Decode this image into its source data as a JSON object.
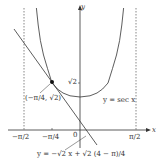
{
  "axes": {
    "x_label": "x",
    "y_label": "y",
    "origin_label": "0",
    "x_ticks": [
      "−π/2",
      "−π/4",
      "π/2"
    ],
    "y_tick": "√2"
  },
  "curve": {
    "label": "y = sec x"
  },
  "point": {
    "label": "(−π/4, √2)"
  },
  "tangent": {
    "label": "y = −√2 x + √2 (4 − π)/4"
  },
  "colors": {
    "line": "#333333",
    "dashed": "#555555"
  }
}
